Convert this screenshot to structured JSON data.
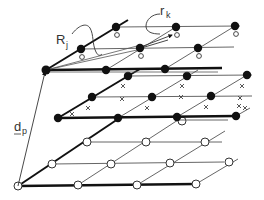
{
  "diagram": {
    "type": "layered lattice / multi-layer grid schematic",
    "colors": {
      "ink": "#111111",
      "thin_line": "#555555",
      "background": "#ffffff"
    },
    "labels": {
      "R": {
        "main": "R",
        "sub": "j"
      },
      "r": {
        "main": "r",
        "sub": "k"
      },
      "d": {
        "main": "d",
        "sub": "p"
      }
    },
    "layers": [
      {
        "name": "top",
        "marker": "filled-dot-with-open-circle",
        "rows": [
          [
            [
              46,
              70
            ],
            [
              106,
              70
            ],
            [
              165,
              69
            ]
          ],
          [
            [
              81,
              49
            ],
            [
              198,
              48
            ]
          ],
          [
            [
              116,
              27
            ],
            [
              176,
              27
            ],
            [
              235,
              26
            ]
          ]
        ],
        "row_line_ends": [
          [
            46,
            70,
            222,
            68
          ],
          [
            81,
            49,
            234,
            47
          ],
          [
            116,
            27,
            240,
            26
          ]
        ],
        "small_circles": [
          [
            81,
            56
          ],
          [
            198,
            55
          ],
          [
            119,
            34
          ],
          [
            179,
            34
          ],
          [
            238,
            33
          ]
        ]
      },
      {
        "name": "middle",
        "marker": "filled-dot",
        "rows": [
          [
            [
              58,
              118
            ],
            [
              118,
              118
            ],
            [
              177,
              117
            ],
            [
              236,
              116
            ]
          ],
          [
            [
              92,
              97
            ],
            [
              152,
              97
            ],
            [
              211,
              96
            ]
          ],
          [
            [
              128,
              76
            ],
            [
              187,
              76
            ],
            [
              247,
              75
            ]
          ]
        ],
        "row_line_ends": [
          [
            58,
            118,
            248,
            116
          ],
          [
            92,
            97,
            252,
            96
          ],
          [
            128,
            76,
            252,
            75
          ]
        ],
        "x_marks": [
          [
            88,
            108
          ],
          [
            148,
            108
          ],
          [
            207,
            107
          ],
          [
            245,
            108
          ],
          [
            123,
            86
          ],
          [
            182,
            86
          ],
          [
            242,
            86
          ],
          [
            213,
            118
          ],
          [
            123,
            100
          ],
          [
            182,
            98
          ]
        ]
      },
      {
        "name": "bottom",
        "marker": "open-circle",
        "rows": [
          [
            [
              18,
              186
            ],
            [
              78,
              185
            ],
            [
              137,
              185
            ],
            [
              196,
              184
            ]
          ],
          [
            [
              52,
              164
            ],
            [
              111,
              164
            ],
            [
              170,
              163
            ],
            [
              229,
              162
            ]
          ],
          [
            [
              87,
              142
            ],
            [
              146,
              142
            ],
            [
              205,
              142
            ]
          ]
        ],
        "row_line_ends": [
          [
            18,
            186,
            196,
            184
          ],
          [
            52,
            164,
            224,
            162
          ],
          [
            87,
            142,
            222,
            142
          ]
        ]
      }
    ]
  }
}
